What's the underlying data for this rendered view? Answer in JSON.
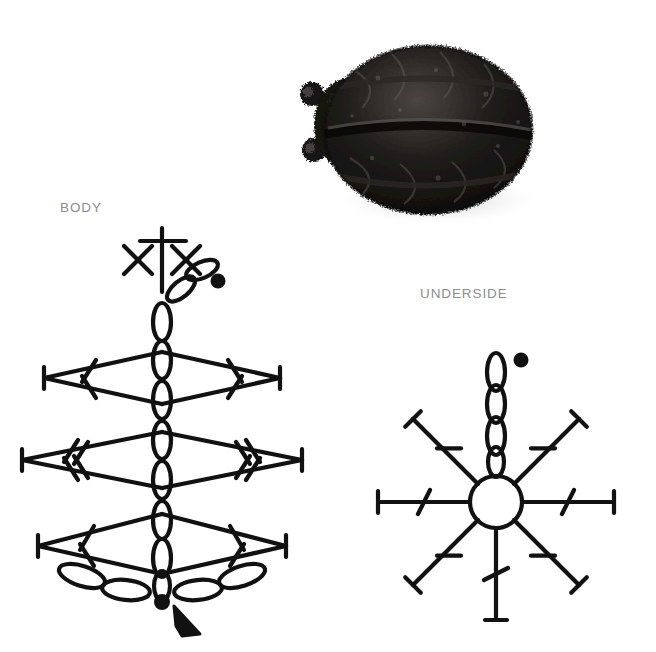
{
  "page": {
    "background": "#ffffff",
    "ink": "#111111",
    "label_color": "#8d8d8d",
    "width": 656,
    "height": 652
  },
  "labels": {
    "body": "BODY",
    "underside": "UNDERSIDE"
  },
  "photo": {
    "name": "crocheted-ladybug-photo",
    "subject": "black crocheted ladybug beetle",
    "yarn_color": "#14110f",
    "highlight_color": "#6e6a66",
    "shadow_color": "#d8d6d4",
    "antennae_count": 2
  },
  "body_diagram": {
    "name": "body-crochet-chart",
    "center_x": 162,
    "symbols": {
      "chain": "oval",
      "single_crochet": "x-cross",
      "double_crochet": "slashed-bar-one",
      "treble_crochet": "slashed-bar-two",
      "start": "filled-dot",
      "direction": "solid-arrowhead"
    },
    "spine_chains": 8,
    "top_cross_count": 1,
    "top_x_count": 2,
    "rows": [
      {
        "label": "row-1",
        "y": 382,
        "half_width": 118,
        "slashes": 1
      },
      {
        "label": "row-2",
        "y": 462,
        "half_width": 140,
        "slashes": 2
      },
      {
        "label": "row-3",
        "y": 542,
        "half_width": 124,
        "slashes": 1
      }
    ],
    "bottom_ovals": 4,
    "start_dot": {
      "x": 162,
      "y": 602
    },
    "top_dot": {
      "x": 218,
      "y": 281
    }
  },
  "underside_diagram": {
    "name": "underside-crochet-chart",
    "center_x": 496,
    "center_y": 502,
    "ring_radius": 26,
    "spokes": 8,
    "spoke_length": 92,
    "spoke_cap": "t-bar",
    "spoke_slashes": 1,
    "start_chains": 4,
    "start_dot": {
      "x": 520,
      "y": 360
    }
  }
}
